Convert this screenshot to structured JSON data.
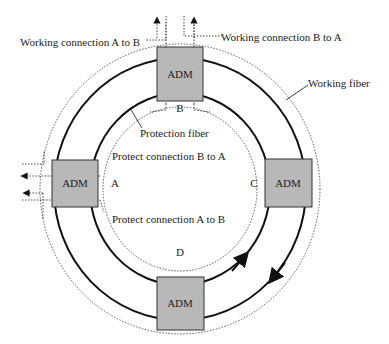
{
  "diagram": {
    "type": "SONET/SDH ring with add-drop multiplexers",
    "nodes": [
      {
        "id": "B",
        "label": "ADM",
        "node_letter": "B",
        "position": "top"
      },
      {
        "id": "A",
        "label": "ADM",
        "node_letter": "A",
        "position": "left"
      },
      {
        "id": "C",
        "label": "ADM",
        "node_letter": "C",
        "position": "right"
      },
      {
        "id": "D",
        "label": "ADM",
        "node_letter": "D",
        "position": "bottom"
      }
    ],
    "labels": {
      "working_a_to_b": "Working connection A to B",
      "working_b_to_a": "Working connection B to A",
      "working_fiber": "Working fiber",
      "protection_fiber": "Protection fiber",
      "protect_b_to_a": "Protect connection B to A",
      "protect_a_to_b": "Protect connection A to B"
    },
    "colors": {
      "adm_fill": "#b8b8b8",
      "adm_stroke": "#333333",
      "fiber": "#111111",
      "dotted": "#333333"
    },
    "icons": {
      "arrow": "arrowhead"
    }
  }
}
